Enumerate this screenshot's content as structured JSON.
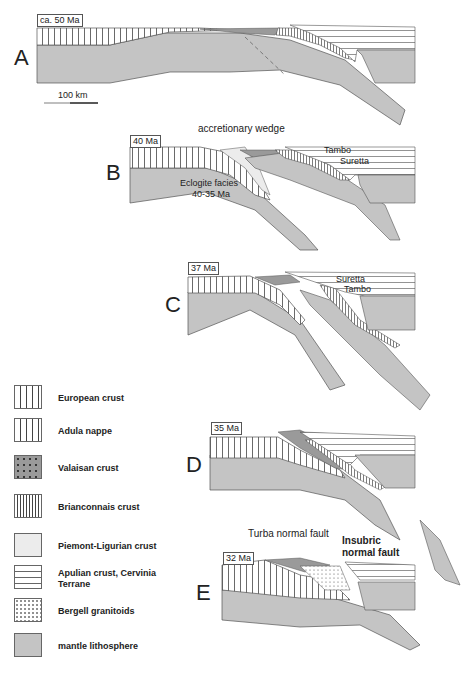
{
  "figure": {
    "panels": [
      {
        "letter": "A",
        "age": "ca. 50 Ma",
        "annotations": []
      },
      {
        "letter": "B",
        "age": "40 Ma",
        "annotations": [
          "accretionary wedge",
          "Tambo",
          "Suretta",
          "Eclogite facies",
          "40-35 Ma"
        ]
      },
      {
        "letter": "C",
        "age": "37 Ma",
        "annotations": [
          "Suretta",
          "Tambo"
        ]
      },
      {
        "letter": "D",
        "age": "35 Ma",
        "annotations": []
      },
      {
        "letter": "E",
        "age": "32 Ma",
        "annotations": [
          "Turba normal fault",
          "Insubric",
          "normal fault"
        ]
      }
    ],
    "scale_bar": "100 km",
    "legend": [
      {
        "label": "European crust",
        "pattern": "vertical-wide"
      },
      {
        "label": "Adula nappe",
        "pattern": "vertical-wide"
      },
      {
        "label": "Valaisan crust",
        "pattern": "dotted-dark"
      },
      {
        "label": "Brianconnais crust",
        "pattern": "vertical-dense"
      },
      {
        "label": "Piemont-Ligurian crust",
        "pattern": "light-grey"
      },
      {
        "label": "Apulian crust, Cervinia",
        "label2": "Terrane",
        "pattern": "horizontal"
      },
      {
        "label": "Bergell granitoids",
        "pattern": "dots"
      },
      {
        "label": "mantle lithosphere",
        "pattern": "grey"
      }
    ],
    "colors": {
      "mantle": "#c4c4c4",
      "piemont": "#ececec",
      "valaisan": "#9a9a9a",
      "line": "#555555"
    }
  }
}
